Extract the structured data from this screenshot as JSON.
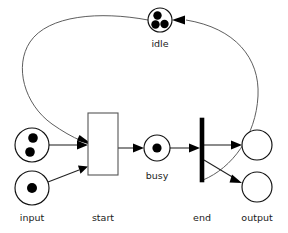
{
  "diagram": {
    "type": "petri-net",
    "background_color": "#ffffff",
    "stroke_color": "#222222",
    "token_color": "#000000",
    "places": [
      {
        "id": "idle",
        "label": "idle",
        "tokens": 3,
        "cx": 160,
        "cy": 20,
        "r": 12,
        "label_x": 160,
        "label_y": 47
      },
      {
        "id": "input-upper",
        "label": "",
        "tokens": 2,
        "cx": 32,
        "cy": 145,
        "r": 17,
        "label_x": 32,
        "label_y": 145
      },
      {
        "id": "input-lower",
        "label": "input",
        "tokens": 1,
        "cx": 32,
        "cy": 188,
        "r": 17,
        "label_x": 32,
        "label_y": 221
      },
      {
        "id": "busy",
        "label": "busy",
        "tokens": 1,
        "cx": 157,
        "cy": 148,
        "r": 13,
        "label_x": 157,
        "label_y": 179
      },
      {
        "id": "output-upper",
        "label": "",
        "tokens": 0,
        "cx": 257,
        "cy": 145,
        "r": 15,
        "label_x": 257,
        "label_y": 145
      },
      {
        "id": "output-lower",
        "label": "output",
        "tokens": 0,
        "cx": 257,
        "cy": 187,
        "r": 15,
        "label_x": 257,
        "label_y": 221
      }
    ],
    "transitions": [
      {
        "id": "start",
        "label": "start",
        "shape": "box",
        "x": 88,
        "y": 113,
        "width": 30,
        "height": 62,
        "label_x": 103,
        "label_y": 221
      },
      {
        "id": "end",
        "label": "end",
        "shape": "bar",
        "x": 200,
        "y": 118,
        "width": 4,
        "height": 64,
        "label_x": 202,
        "label_y": 221
      }
    ],
    "arcs": [
      {
        "id": "arc-input-upper-to-start",
        "from": "input-upper",
        "to": "start",
        "kind": "straight"
      },
      {
        "id": "arc-input-lower-to-start",
        "from": "input-lower",
        "to": "start",
        "kind": "straight"
      },
      {
        "id": "arc-idle-to-start",
        "from": "idle",
        "to": "start",
        "kind": "curve"
      },
      {
        "id": "arc-start-to-busy",
        "from": "start",
        "to": "busy",
        "kind": "straight"
      },
      {
        "id": "arc-busy-to-end",
        "from": "busy",
        "to": "end",
        "kind": "straight"
      },
      {
        "id": "arc-end-to-output-upper",
        "from": "end",
        "to": "output-upper",
        "kind": "straight"
      },
      {
        "id": "arc-end-to-output-lower",
        "from": "end",
        "to": "output-lower",
        "kind": "straight"
      },
      {
        "id": "arc-end-to-idle",
        "from": "end",
        "to": "idle",
        "kind": "curve"
      }
    ]
  },
  "labels": {
    "idle": "idle",
    "input": "input",
    "start": "start",
    "busy": "busy",
    "end": "end",
    "output": "output"
  }
}
